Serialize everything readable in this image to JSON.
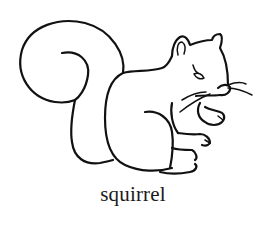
{
  "illustration": {
    "subject": "squirrel",
    "style": "black line art on white",
    "stroke_color": "#111111",
    "background_color": "#ffffff"
  },
  "caption": {
    "text": "squirrel"
  }
}
